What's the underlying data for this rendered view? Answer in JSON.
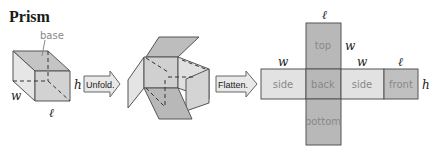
{
  "title": "Prism",
  "prism": {
    "base_label": "base",
    "w": "w",
    "h": "h",
    "l": "ℓ"
  },
  "arrows": {
    "unfold": "Unfold.",
    "flatten": "Flatten."
  },
  "net": {
    "faces": {
      "top": "top",
      "side_left": "side",
      "back": "back",
      "side_right": "side",
      "front": "front",
      "bottom": "bottom"
    },
    "dims": {
      "l_top": "ℓ",
      "w_top": "w",
      "w_left": "w",
      "w_mid": "w",
      "l_front": "ℓ",
      "h": "h"
    }
  },
  "colors": {
    "light_face": "#e2e2e2",
    "dark_face": "#b8b8b8",
    "mid_face": "#cfcfcf",
    "stroke": "#555555"
  }
}
